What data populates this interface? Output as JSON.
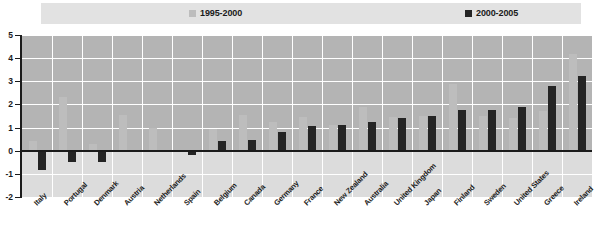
{
  "legend": {
    "entries": [
      {
        "label": "1995-2000",
        "color": "#bdbdbd"
      },
      {
        "label": "2000-2005",
        "color": "#242424"
      }
    ]
  },
  "axis": {
    "y_ticks": [
      "5",
      "4",
      "3",
      "2",
      "1",
      "0",
      "-1",
      "-2"
    ]
  },
  "chart_data": {
    "type": "bar",
    "title": "",
    "subtitle": "",
    "xlabel": "",
    "ylabel": "",
    "ylim": [
      -2,
      5
    ],
    "ytick_values": [
      5,
      4,
      3,
      2,
      1,
      0,
      -1,
      -2
    ],
    "grid": true,
    "legend_position": "top",
    "categories": [
      "Italy",
      "Portugal",
      "Denmark",
      "Austria",
      "Netherlands",
      "Spain",
      "Belgium",
      "Canada",
      "Germany",
      "France",
      "New Zealand",
      "Australia",
      "United Kingdom",
      "Japan",
      "Finland",
      "Sweden",
      "United States",
      "Greece",
      "Ireland"
    ],
    "series": [
      {
        "name": "1995-2000",
        "color": "#bdbdbd",
        "values": [
          0.4,
          2.3,
          0.3,
          1.55,
          1.0,
          0.0,
          0.95,
          1.55,
          1.25,
          1.45,
          1.1,
          1.9,
          1.45,
          1.5,
          2.9,
          1.5,
          1.4,
          1.7,
          4.2
        ]
      },
      {
        "name": "2000-2005",
        "color": "#242424",
        "values": [
          -0.85,
          -0.5,
          -0.5,
          -0.05,
          0.0,
          -0.2,
          0.4,
          0.45,
          0.8,
          1.05,
          1.1,
          1.25,
          1.4,
          1.5,
          1.75,
          1.75,
          1.9,
          2.8,
          3.25
        ]
      }
    ]
  }
}
